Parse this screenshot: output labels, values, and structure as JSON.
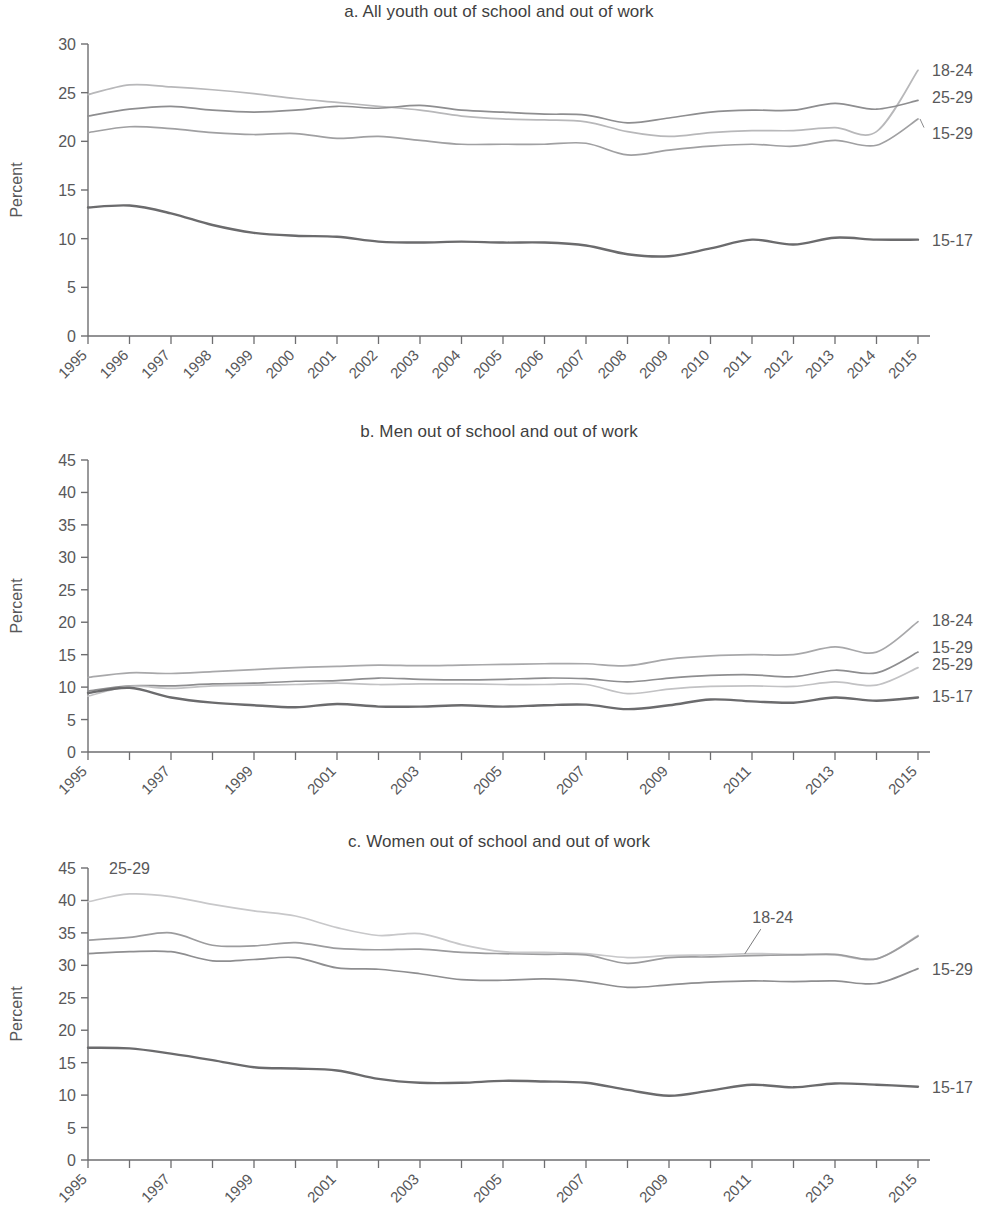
{
  "figure": {
    "ylabel": "Percent",
    "panels": [
      {
        "id": "a",
        "title": "a. All youth out of school and out of work",
        "ylabel": "Percent"
      },
      {
        "id": "b",
        "title": "b. Men out of school and out of work",
        "ylabel": "Percent"
      },
      {
        "id": "c",
        "title": "c. Women out of school and out of work",
        "ylabel": "Percent"
      }
    ]
  },
  "chart_data": [
    {
      "type": "line",
      "title": "a. All youth out of school and out of work",
      "xlabel": "",
      "ylabel": "Percent",
      "ylim": [
        0,
        30
      ],
      "yticks": [
        0,
        5,
        10,
        15,
        20,
        25,
        30
      ],
      "xlim": [
        1995,
        2015
      ],
      "x": [
        1995,
        1996,
        1997,
        1998,
        1999,
        2000,
        2001,
        2002,
        2003,
        2004,
        2005,
        2006,
        2007,
        2008,
        2009,
        2010,
        2011,
        2012,
        2013,
        2014,
        2015
      ],
      "xticks": [
        1995,
        1996,
        1997,
        1998,
        1999,
        2000,
        2001,
        2002,
        2003,
        2004,
        2005,
        2006,
        2007,
        2008,
        2009,
        2010,
        2011,
        2012,
        2013,
        2014,
        2015
      ],
      "grid": false,
      "legend_position": "right-of-plot-line-ends",
      "series": [
        {
          "name": "18-24",
          "color": "#b8b8ba",
          "values": [
            24.8,
            25.8,
            25.6,
            25.3,
            24.9,
            24.4,
            24.0,
            23.6,
            23.2,
            22.6,
            22.3,
            22.2,
            22.0,
            21.0,
            20.5,
            20.9,
            21.1,
            21.1,
            21.4,
            21.0,
            27.3
          ]
        },
        {
          "name": "25-29",
          "color": "#8e8e90",
          "values": [
            22.6,
            23.3,
            23.6,
            23.2,
            23.0,
            23.2,
            23.6,
            23.4,
            23.7,
            23.2,
            23.0,
            22.8,
            22.7,
            21.9,
            22.4,
            23.0,
            23.2,
            23.2,
            23.9,
            23.3,
            24.2
          ]
        },
        {
          "name": "15-29",
          "color": "#a0a0a2",
          "values": [
            20.9,
            21.5,
            21.3,
            20.9,
            20.7,
            20.8,
            20.3,
            20.5,
            20.1,
            19.7,
            19.7,
            19.7,
            19.8,
            18.6,
            19.1,
            19.5,
            19.7,
            19.5,
            20.1,
            19.6,
            22.3
          ]
        },
        {
          "name": "15-17",
          "color": "#6b6b6d",
          "values": [
            13.2,
            13.4,
            12.6,
            11.4,
            10.6,
            10.3,
            10.2,
            9.7,
            9.6,
            9.7,
            9.6,
            9.6,
            9.3,
            8.4,
            8.2,
            9.0,
            9.9,
            9.4,
            10.1,
            9.9,
            9.9
          ]
        }
      ],
      "series_label_positions": [
        {
          "name": "18-24",
          "y": 27.3
        },
        {
          "name": "25-29",
          "y": 24.6
        },
        {
          "name": "15-29",
          "y": 20.9
        },
        {
          "name": "15-17",
          "y": 9.9
        }
      ]
    },
    {
      "type": "line",
      "title": "b. Men out of school and out of work",
      "xlabel": "",
      "ylabel": "Percent",
      "ylim": [
        0,
        45
      ],
      "yticks": [
        0,
        5,
        10,
        15,
        20,
        25,
        30,
        35,
        40,
        45
      ],
      "xlim": [
        1995,
        2015
      ],
      "x": [
        1995,
        1996,
        1997,
        1998,
        1999,
        2000,
        2001,
        2002,
        2003,
        2004,
        2005,
        2006,
        2007,
        2008,
        2009,
        2010,
        2011,
        2012,
        2013,
        2014,
        2015
      ],
      "xticks": [
        1995,
        1997,
        1999,
        2001,
        2003,
        2005,
        2007,
        2009,
        2011,
        2013,
        2015
      ],
      "grid": false,
      "legend_position": "right-of-plot-line-ends",
      "series": [
        {
          "name": "18-24",
          "color": "#a8a8aa",
          "values": [
            11.5,
            12.2,
            12.1,
            12.4,
            12.7,
            13.0,
            13.2,
            13.4,
            13.3,
            13.4,
            13.5,
            13.6,
            13.6,
            13.3,
            14.3,
            14.8,
            15.0,
            15.0,
            16.2,
            15.4,
            20.1
          ]
        },
        {
          "name": "15-29",
          "color": "#8e8e90",
          "values": [
            9.4,
            10.2,
            10.2,
            10.5,
            10.6,
            10.9,
            11.0,
            11.4,
            11.2,
            11.1,
            11.2,
            11.4,
            11.3,
            10.8,
            11.4,
            11.8,
            11.9,
            11.6,
            12.6,
            12.2,
            15.4
          ]
        },
        {
          "name": "25-29",
          "color": "#c2c2c4",
          "values": [
            8.6,
            10.1,
            9.8,
            10.2,
            10.3,
            10.4,
            10.6,
            10.4,
            10.5,
            10.5,
            10.4,
            10.4,
            10.4,
            9.0,
            9.7,
            10.1,
            10.2,
            10.1,
            10.8,
            10.3,
            13.0
          ]
        },
        {
          "name": "15-17",
          "color": "#6b6b6d",
          "values": [
            9.1,
            9.9,
            8.4,
            7.6,
            7.2,
            6.9,
            7.4,
            7.0,
            7.0,
            7.2,
            7.0,
            7.2,
            7.3,
            6.6,
            7.2,
            8.1,
            7.8,
            7.6,
            8.4,
            7.9,
            8.4
          ]
        }
      ],
      "series_label_positions": [
        {
          "name": "18-24",
          "y": 20.4
        },
        {
          "name": "15-29",
          "y": 16.2
        },
        {
          "name": "25-29",
          "y": 13.6
        },
        {
          "name": "15-17",
          "y": 8.6
        }
      ]
    },
    {
      "type": "line",
      "title": "c. Women out of school and out of work",
      "xlabel": "",
      "ylabel": "Percent",
      "ylim": [
        0,
        45
      ],
      "yticks": [
        0,
        5,
        10,
        15,
        20,
        25,
        30,
        35,
        40,
        45
      ],
      "xlim": [
        1995,
        2015
      ],
      "x": [
        1995,
        1996,
        1997,
        1998,
        1999,
        2000,
        2001,
        2002,
        2003,
        2004,
        2005,
        2006,
        2007,
        2008,
        2009,
        2010,
        2011,
        2012,
        2013,
        2014,
        2015
      ],
      "xticks": [
        1995,
        1997,
        1999,
        2001,
        2003,
        2005,
        2007,
        2009,
        2011,
        2013,
        2015
      ],
      "grid": false,
      "legend_position": "inline-annotations",
      "series": [
        {
          "name": "25-29",
          "color": "#c8c8ca",
          "values": [
            39.8,
            41.0,
            40.6,
            39.4,
            38.4,
            37.6,
            35.8,
            34.6,
            34.9,
            33.2,
            32.1,
            32.0,
            31.8,
            31.2,
            31.5,
            31.6,
            31.8,
            31.7,
            31.6,
            31.0,
            34.6
          ]
        },
        {
          "name": "18-24",
          "color": "#9c9c9e",
          "values": [
            33.9,
            34.3,
            35.0,
            33.1,
            33.0,
            33.5,
            32.6,
            32.4,
            32.5,
            32.0,
            31.8,
            31.7,
            31.6,
            30.3,
            31.2,
            31.3,
            31.5,
            31.6,
            31.7,
            31.0,
            34.5
          ]
        },
        {
          "name": "15-29",
          "color": "#8e8e90",
          "values": [
            31.8,
            32.1,
            32.1,
            30.7,
            30.9,
            31.2,
            29.6,
            29.4,
            28.7,
            27.8,
            27.7,
            27.9,
            27.5,
            26.6,
            27.0,
            27.4,
            27.6,
            27.5,
            27.6,
            27.2,
            29.5
          ]
        },
        {
          "name": "15-17",
          "color": "#6b6b6d",
          "values": [
            17.3,
            17.2,
            16.4,
            15.4,
            14.3,
            14.1,
            13.8,
            12.5,
            11.9,
            11.9,
            12.2,
            12.1,
            11.9,
            10.8,
            9.9,
            10.7,
            11.6,
            11.2,
            11.8,
            11.6,
            11.3
          ]
        }
      ],
      "series_label_positions": [
        {
          "name": "25-29",
          "y": 44.0,
          "x": 1996,
          "inline": true
        },
        {
          "name": "18-24",
          "y": 36.5,
          "x": 2011.5,
          "inline": true,
          "leader": true
        },
        {
          "name": "15-29",
          "y": 29.5
        },
        {
          "name": "15-17",
          "y": 11.3
        }
      ]
    }
  ]
}
